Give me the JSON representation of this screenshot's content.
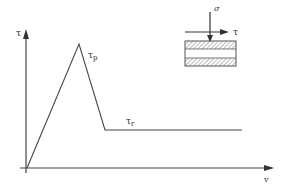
{
  "diagram": {
    "type": "shear stress vs displacement curve",
    "axes": {
      "y_label": "τ",
      "x_label": "v"
    },
    "curve": {
      "points": [
        [
          27,
          168
        ],
        [
          79,
          44
        ],
        [
          105,
          130
        ],
        [
          242,
          130
        ]
      ],
      "peak_label": "τ",
      "peak_label_sub": "p",
      "residual_label": "τ",
      "residual_label_sub": "r"
    },
    "specimen": {
      "normal_load_label": "σ",
      "shear_label": "τ"
    },
    "colors": {
      "line": "#444444",
      "hatch": "#666666",
      "background": "#ffffff"
    }
  }
}
